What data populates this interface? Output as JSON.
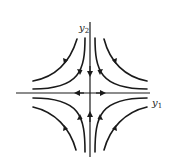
{
  "diagram": {
    "type": "phase-portrait",
    "axes": {
      "horizontal": {
        "label": "y",
        "subscript": "1"
      },
      "vertical": {
        "label": "y",
        "subscript": "2"
      }
    },
    "colors": {
      "stroke": "#1a1a1a",
      "axis": "#1a1a1a",
      "background": "#ffffff"
    },
    "flow": {
      "vertical_axis_direction": "toward origin",
      "horizontal_axis_direction": "away from origin"
    }
  }
}
